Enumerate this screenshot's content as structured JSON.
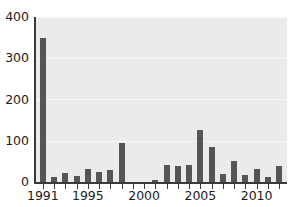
{
  "chart_data": {
    "type": "bar",
    "title": "",
    "subtitle": "",
    "xlabel": "",
    "ylabel": "",
    "xlim": [
      1990.3,
      2012.7
    ],
    "ylim": [
      0,
      400
    ],
    "grid": true,
    "legend": false,
    "bar_color": "#555555",
    "plot_background": "#ebebeb",
    "gridline_color": "#f7f7f7",
    "axis_color": "#3a3a3a",
    "y_ticks": [
      0,
      100,
      200,
      300,
      400
    ],
    "y_tick_labels": [
      "0",
      "100",
      "200",
      "300",
      "400"
    ],
    "x_ticks": [
      1991,
      1992,
      1993,
      1994,
      1995,
      1996,
      1997,
      1998,
      1999,
      2000,
      2001,
      2002,
      2003,
      2004,
      2005,
      2006,
      2007,
      2008,
      2009,
      2010,
      2011,
      2012
    ],
    "x_tick_labels_shown": [
      "1991",
      "1995",
      "2000",
      "2005",
      "2010"
    ],
    "x_labeled_ticks": [
      1991,
      1995,
      2000,
      2005,
      2010
    ],
    "categories": [
      1991,
      1992,
      1993,
      1994,
      1995,
      1996,
      1997,
      1998,
      1999,
      2000,
      2001,
      2002,
      2003,
      2004,
      2005,
      2006,
      2007,
      2008,
      2009,
      2010,
      2011,
      2012
    ],
    "values": [
      350,
      12,
      22,
      14,
      32,
      25,
      30,
      95,
      0,
      0,
      6,
      42,
      38,
      42,
      125,
      85,
      20,
      50,
      16,
      32,
      12,
      40
    ]
  }
}
